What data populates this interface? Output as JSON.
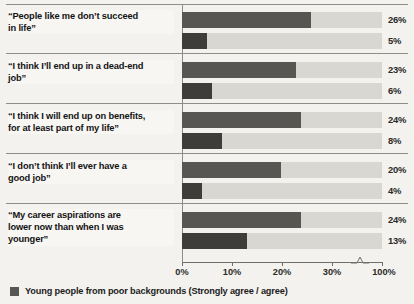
{
  "chart_data": {
    "type": "bar",
    "orientation": "horizontal",
    "title": "",
    "xlabel": "",
    "ylabel": "",
    "grid": false,
    "legend_position": "bottom-left",
    "xlim": [
      0,
      100
    ],
    "xticks": [
      "0%",
      "10%",
      "20%",
      "30%",
      "100%"
    ],
    "xtick_values": [
      0,
      10,
      20,
      30,
      100
    ],
    "axis_break": {
      "between": [
        30,
        100
      ],
      "style": "zigzag"
    },
    "categories": [
      "“People like me don’t succeed in life”",
      "“I think I’ll end up in a dead-end job”",
      "“I think I will end up on benefits, for at least part of my life”",
      "“I don’t think I’ll ever have a good job”",
      "“My career aspirations are lower now than when I was younger”"
    ],
    "series": [
      {
        "name": "Young people from poor backgrounds (Strongly agree / agree)",
        "values": [
          26,
          23,
          24,
          20,
          24
        ]
      },
      {
        "name": "Second bar",
        "values": [
          5,
          6,
          8,
          4,
          13
        ]
      }
    ],
    "colors": {
      "bar_primary": "#575652",
      "bar_secondary": "#3e3d3a",
      "track": "#d8d7d2",
      "background": "#f3f2ee",
      "rule": "#8e8d88",
      "text": "#1c1c1c"
    }
  },
  "rows": [
    {
      "label_line1": "“People like me don’t succeed",
      "label_line2": "in life”",
      "label_line3": "",
      "bar_top_pct": "26%",
      "bar_bottom_pct": "5%",
      "bar_top_value": 26,
      "bar_bottom_value": 5
    },
    {
      "label_line1": "“I think I’ll end up in a dead-end",
      "label_line2": "job”",
      "label_line3": "",
      "bar_top_pct": "23%",
      "bar_bottom_pct": "6%",
      "bar_top_value": 23,
      "bar_bottom_value": 6
    },
    {
      "label_line1": "“I think I will end up on benefits,",
      "label_line2": "for at least part of my life”",
      "label_line3": "",
      "bar_top_pct": "24%",
      "bar_bottom_pct": "8%",
      "bar_top_value": 24,
      "bar_bottom_value": 8
    },
    {
      "label_line1": "“I don’t think I’ll ever have a",
      "label_line2": "good job”",
      "label_line3": "",
      "bar_top_pct": "20%",
      "bar_bottom_pct": "4%",
      "bar_top_value": 20,
      "bar_bottom_value": 4
    },
    {
      "label_line1": "“My career aspirations are",
      "label_line2": "lower now than when I was",
      "label_line3": "younger”",
      "bar_top_pct": "24%",
      "bar_bottom_pct": "13%",
      "bar_top_value": 24,
      "bar_bottom_value": 13
    }
  ],
  "axis": {
    "ticks": [
      {
        "label": "0%",
        "value": 0
      },
      {
        "label": "10%",
        "value": 10
      },
      {
        "label": "20%",
        "value": 20
      },
      {
        "label": "30%",
        "value": 30
      },
      {
        "label": "100%",
        "value": 100
      }
    ]
  },
  "legend": {
    "label": "Young people from poor backgrounds (Strongly agree / agree)"
  }
}
